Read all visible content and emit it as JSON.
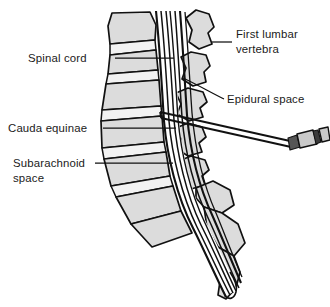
{
  "figure": {
    "type": "anatomical-line-diagram",
    "background_color": "#ffffff",
    "bone_fill_color": "#dcdcdc",
    "outline_color": "#111111",
    "canal_fill_color": "#ffffff",
    "label_color": "#1a1a1a"
  },
  "labels": {
    "spinal_cord": {
      "text": "Spinal cord",
      "side": "left",
      "lines": [
        "Spinal cord"
      ]
    },
    "cauda_equinae": {
      "text": "Cauda equinae",
      "side": "left",
      "lines": [
        "Cauda equinae"
      ]
    },
    "subarachnoid_space": {
      "text": "Subarachnoid space",
      "side": "left",
      "lines": [
        "Subarachnoid",
        "space"
      ],
      "line1": "Subarachnoid",
      "line2": "space"
    },
    "first_lumbar_vertebra": {
      "text": "First lumbar vertebra",
      "side": "right",
      "lines": [
        "First lumbar",
        "vertebra"
      ],
      "line1": "First lumbar",
      "line2": "vertebra"
    },
    "epidural_space": {
      "text": "Epidural space",
      "side": "right",
      "lines": [
        "Epidural space"
      ]
    }
  },
  "structures": {
    "vertebral_bodies_count": 7,
    "spinous_processes_count": 5,
    "needle": {
      "name": "spinal-needle",
      "description": "needle with syringe hub entering between spinous processes"
    },
    "syringe": {
      "name": "syringe-hub",
      "description": "hub, barrel and plunger flange at needle end"
    },
    "sacrum": {
      "name": "sacrum"
    },
    "coccyx": {
      "name": "coccyx"
    }
  }
}
